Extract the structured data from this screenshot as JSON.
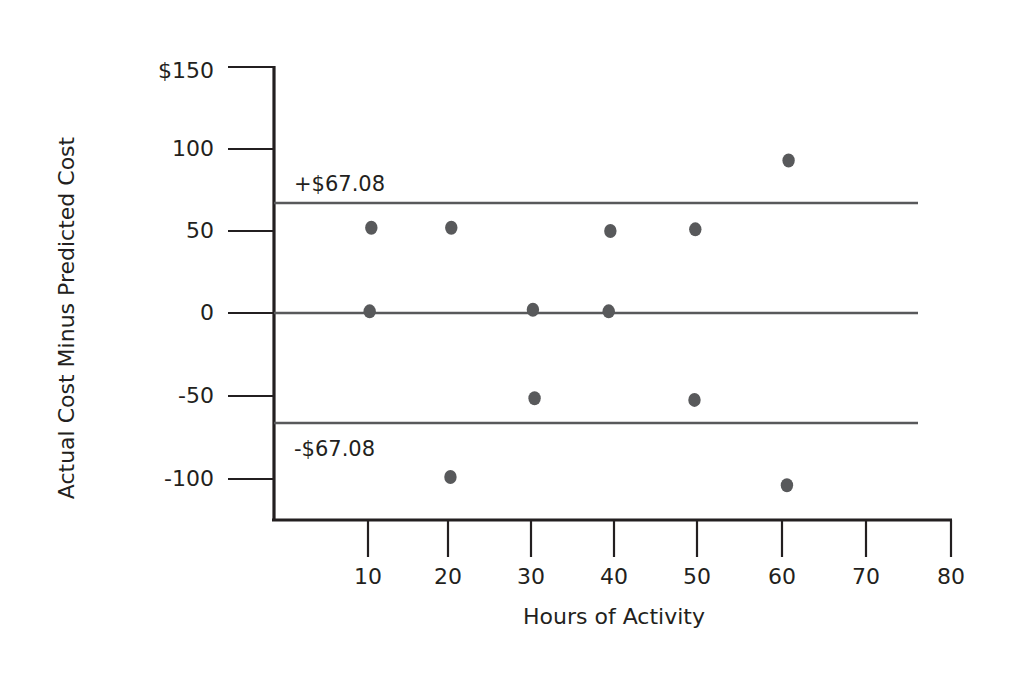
{
  "chart_data": {
    "type": "scatter",
    "title": "",
    "subtitle": "",
    "xlabel": "Hours of Activity",
    "ylabel": "Actual Cost Minus Predicted Cost",
    "xlim": [
      0,
      80
    ],
    "ylim": [
      -120,
      150
    ],
    "xticks": [
      10,
      20,
      30,
      40,
      50,
      60,
      70,
      80
    ],
    "xtick_labels": [
      "10",
      "20",
      "30",
      "40",
      "50",
      "60",
      "70",
      "80"
    ],
    "yticks": [
      150,
      100,
      50,
      0,
      -50,
      -100
    ],
    "ytick_labels": [
      "$150",
      "100",
      "50",
      "0",
      "-50",
      "-100"
    ],
    "grid": false,
    "legend": "none",
    "series": [
      {
        "name": "Residuals",
        "marker": "filled-circle",
        "color": "#58595b",
        "points": [
          {
            "x": 10.4,
            "y": 52
          },
          {
            "x": 20.0,
            "y": 52
          },
          {
            "x": 39.1,
            "y": 50
          },
          {
            "x": 49.3,
            "y": 51
          },
          {
            "x": 60.5,
            "y": 93
          },
          {
            "x": 10.2,
            "y": 1
          },
          {
            "x": 29.8,
            "y": 2
          },
          {
            "x": 38.9,
            "y": 1
          },
          {
            "x": 30.0,
            "y": -52
          },
          {
            "x": 49.2,
            "y": -53
          },
          {
            "x": 19.9,
            "y": -100
          },
          {
            "x": 60.3,
            "y": -105
          }
        ]
      }
    ],
    "reference_lines": [
      {
        "name": "upper-limit",
        "value": 67.08,
        "label": "+$67.08",
        "color": "#58595b"
      },
      {
        "name": "center-line",
        "value": 0,
        "label": "",
        "color": "#58595b"
      },
      {
        "name": "lower-limit",
        "value": -67.08,
        "label": "-$67.08",
        "color": "#58595b"
      }
    ]
  },
  "axes": {
    "y_title": "Actual Cost Minus Predicted Cost",
    "x_title": "Hours of Activity",
    "y_labels": {
      "t150": "$150",
      "t100": "100",
      "t50": "50",
      "t0": "0",
      "tm50": "-50",
      "tm100": "-100"
    },
    "x_labels": {
      "t10": "10",
      "t20": "20",
      "t30": "30",
      "t40": "40",
      "t50": "50",
      "t60": "60",
      "t70": "70",
      "t80": "80"
    }
  },
  "annotations": {
    "upper_limit_label": "+$67.08",
    "lower_limit_label": "-$67.08"
  },
  "colors": {
    "ink": "#231f20",
    "marker": "#58595b",
    "reference_line": "#58595b",
    "background": "#ffffff"
  }
}
